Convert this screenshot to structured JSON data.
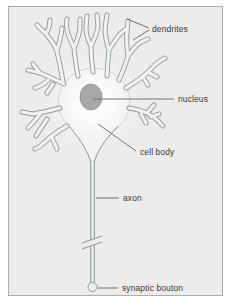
{
  "diagram": {
    "labels": {
      "dendrites": "dendrites",
      "nucleus": "nucleus",
      "cell_body": "cell body",
      "axon": "axon",
      "synaptic_bouton": "synaptic bouton"
    },
    "colors": {
      "canvas_bg": "#ffffff",
      "panel_bg": "#ececea",
      "panel_border": "#a9aeae",
      "tube_outline": "#939b9b",
      "tube_fill": "#f1f1ef",
      "soma_glow": "#ffffff",
      "nucleus_fill": "#a8a8a8",
      "pointer_line": "#6e7373",
      "label_text": "#3b3b3b"
    }
  }
}
